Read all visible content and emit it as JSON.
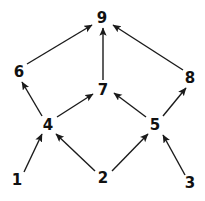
{
  "diagram": {
    "kind": "directed-graph",
    "background_color": "#ffffff",
    "node_color": "#111111",
    "edge_color": "#1a1a1a",
    "nodes": [
      {
        "id": "1",
        "label": "1",
        "x": 17,
        "y": 180
      },
      {
        "id": "2",
        "label": "2",
        "x": 103,
        "y": 178
      },
      {
        "id": "3",
        "label": "3",
        "x": 190,
        "y": 183
      },
      {
        "id": "4",
        "label": "4",
        "x": 48,
        "y": 125
      },
      {
        "id": "5",
        "label": "5",
        "x": 155,
        "y": 125
      },
      {
        "id": "6",
        "label": "6",
        "x": 19,
        "y": 72
      },
      {
        "id": "7",
        "label": "7",
        "x": 103,
        "y": 90
      },
      {
        "id": "8",
        "label": "8",
        "x": 190,
        "y": 78
      },
      {
        "id": "9",
        "label": "9",
        "x": 102,
        "y": 18
      }
    ],
    "edges": [
      {
        "from": "1",
        "to": "4",
        "x1": 24,
        "y1": 172,
        "x2": 42,
        "y2": 134
      },
      {
        "from": "2",
        "to": "4",
        "x1": 95,
        "y1": 171,
        "x2": 56,
        "y2": 134
      },
      {
        "from": "2",
        "to": "5",
        "x1": 112,
        "y1": 171,
        "x2": 148,
        "y2": 134
      },
      {
        "from": "3",
        "to": "5",
        "x1": 185,
        "y1": 175,
        "x2": 163,
        "y2": 135
      },
      {
        "from": "4",
        "to": "6",
        "x1": 42,
        "y1": 116,
        "x2": 22,
        "y2": 82
      },
      {
        "from": "4",
        "to": "7",
        "x1": 57,
        "y1": 117,
        "x2": 93,
        "y2": 94
      },
      {
        "from": "5",
        "to": "7",
        "x1": 146,
        "y1": 117,
        "x2": 114,
        "y2": 93
      },
      {
        "from": "5",
        "to": "8",
        "x1": 163,
        "y1": 116,
        "x2": 186,
        "y2": 88
      },
      {
        "from": "6",
        "to": "9",
        "x1": 27,
        "y1": 64,
        "x2": 92,
        "y2": 25
      },
      {
        "from": "7",
        "to": "9",
        "x1": 103,
        "y1": 80,
        "x2": 103,
        "y2": 28
      },
      {
        "from": "8",
        "to": "9",
        "x1": 183,
        "y1": 70,
        "x2": 113,
        "y2": 25
      }
    ]
  }
}
